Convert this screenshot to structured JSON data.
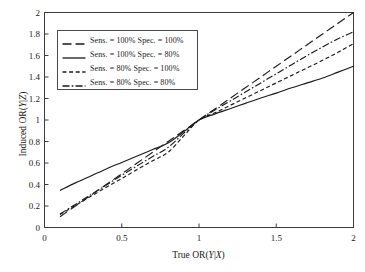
{
  "chart_data": {
    "type": "line",
    "title": "",
    "xlabel": "True OR(Y|X)",
    "ylabel": "Induced OR(Y|Z)",
    "xlim": [
      0,
      2
    ],
    "ylim": [
      0,
      2
    ],
    "grid": false,
    "legend_position": "upper-left",
    "xticks": [
      "0",
      "0.5",
      "1",
      "1.5",
      "2"
    ],
    "xtick_values": [
      0,
      0.5,
      1,
      1.5,
      2
    ],
    "yticks": [
      "0",
      "0.2",
      "0.4",
      "0.6",
      "0.8",
      "1",
      "1.2",
      "1.4",
      "1.6",
      "1.8",
      "2"
    ],
    "ytick_values": [
      0,
      0.2,
      0.4,
      0.6,
      0.8,
      1,
      1.2,
      1.4,
      1.6,
      1.8,
      2
    ],
    "x": [
      0.1,
      0.2,
      0.3,
      0.4,
      0.5,
      0.6,
      0.7,
      0.8,
      0.9,
      1.0,
      1.1,
      1.2,
      1.3,
      1.4,
      1.5,
      1.6,
      1.7,
      1.8,
      1.9,
      2.0
    ],
    "series": [
      {
        "name": "Sens. = 100% Spec. = 100%",
        "sensitivity": "100%",
        "specificity": "100%",
        "style": "long-dash",
        "values": [
          0.1,
          0.2,
          0.3,
          0.4,
          0.5,
          0.6,
          0.7,
          0.8,
          0.9,
          1.0,
          1.1,
          1.2,
          1.3,
          1.4,
          1.5,
          1.6,
          1.7,
          1.8,
          1.9,
          2.0
        ]
      },
      {
        "name": "Sens. = 100% Spec. = 80%",
        "sensitivity": "100%",
        "specificity": "80%",
        "style": "solid",
        "values": [
          0.345,
          0.415,
          0.48,
          0.545,
          0.605,
          0.665,
          0.725,
          0.785,
          0.89,
          1.0,
          1.055,
          1.105,
          1.155,
          1.205,
          1.25,
          1.3,
          1.345,
          1.39,
          1.445,
          1.5
        ]
      },
      {
        "name": "Sens. = 80%   Spec. = 100%",
        "sensitivity": "80%",
        "specificity": "100%",
        "style": "short-dash",
        "values": [
          0.12,
          0.205,
          0.29,
          0.375,
          0.455,
          0.54,
          0.62,
          0.7,
          0.85,
          1.0,
          1.065,
          1.135,
          1.205,
          1.275,
          1.345,
          1.415,
          1.485,
          1.555,
          1.63,
          1.71
        ]
      },
      {
        "name": "Sens. = 80%   Spec. = 80%",
        "sensitivity": "80%",
        "specificity": "80%",
        "style": "dash-dot",
        "values": [
          0.125,
          0.215,
          0.305,
          0.395,
          0.485,
          0.575,
          0.66,
          0.745,
          0.875,
          1.0,
          1.09,
          1.175,
          1.26,
          1.345,
          1.43,
          1.515,
          1.6,
          1.68,
          1.755,
          1.82
        ]
      }
    ],
    "colors": {
      "line": "#1a1a1a",
      "axis": "#3c3c3c",
      "background": "#ffffff"
    }
  },
  "legend": {
    "entries": [
      {
        "label": "Sens. = 100% Spec. = 100%",
        "style": "long-dash"
      },
      {
        "label": "Sens. = 100% Spec. = 80%",
        "style": "solid"
      },
      {
        "label": "Sens. = 80%   Spec. = 100%",
        "style": "short-dash"
      },
      {
        "label": "Sens. = 80%   Spec. = 80%",
        "style": "dash-dot"
      }
    ]
  },
  "axis_titles": {
    "x_prefix": "True OR(",
    "x_var1": "Y",
    "x_sep": "|",
    "x_var2": "X",
    "x_suffix": ")",
    "y_prefix": "Induced OR(",
    "y_var1": "Y",
    "y_sep": "|",
    "y_var2": "Z",
    "y_suffix": ")"
  }
}
